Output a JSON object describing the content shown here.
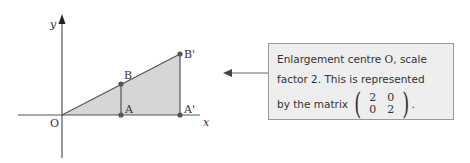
{
  "diagram": {
    "axes": {
      "x_label": "x",
      "y_label": "y",
      "origin_label": "O"
    },
    "points": [
      {
        "id": "O",
        "label": "O",
        "coord": [
          0,
          0
        ]
      },
      {
        "id": "A",
        "label": "A",
        "coord": [
          2,
          0
        ]
      },
      {
        "id": "B",
        "label": "B",
        "coord": [
          2,
          1
        ]
      },
      {
        "id": "A_prime",
        "label": "A'",
        "coord": [
          4,
          0
        ]
      },
      {
        "id": "B_prime",
        "label": "B'",
        "coord": [
          4,
          2
        ]
      }
    ],
    "shapes": [
      {
        "name": "triangle-OAB",
        "vertices": [
          "O",
          "A",
          "B"
        ]
      },
      {
        "name": "triangle-OA'B'",
        "vertices": [
          "O",
          "A'",
          "B'"
        ]
      }
    ],
    "colors": {
      "fill": "#d4d4d4",
      "line": "#555555",
      "point": "#555555"
    }
  },
  "note": {
    "line1_pre": "Enlargement centre ",
    "line1_O": "O",
    "line1_post": ", scale",
    "line2": "factor 2. This is represented",
    "line3": "by the matrix",
    "matrix": [
      [
        "2",
        "0"
      ],
      [
        "0",
        "2"
      ]
    ],
    "trailing": "."
  }
}
